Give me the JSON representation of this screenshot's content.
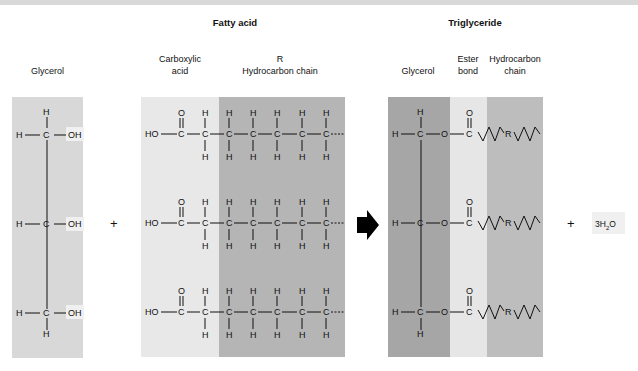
{
  "titles": {
    "fatty_acid": "Fatty acid",
    "triglyceride": "Triglyceride"
  },
  "labels": {
    "glycerol": "Glycerol",
    "carboxylic_acid_1": "Carboxylic",
    "carboxylic_acid_2": "acid",
    "r": "R",
    "hydrocarbon_chain": "Hydrocarbon chain",
    "tri_glycerol": "Glycerol",
    "ester_1": "Ester",
    "ester_2": "bond",
    "tri_hydro_1": "Hydrocarbon",
    "tri_hydro_2": "chain"
  },
  "symbols": {
    "plus": "+",
    "water": "3H₂O",
    "hydroxyl": "OH",
    "ho": "HO",
    "h": "H",
    "c": "C",
    "o": "O",
    "r": "R"
  },
  "colors": {
    "glycerol_box": "#d8d8d8",
    "carboxyl_box": "#e8e8e8",
    "hydrocarbon_box": "#b5b5b5",
    "tri_glycerol_box": "#a6a6a6",
    "ester_box": "#e6e6e6",
    "tri_hydro_box": "#bdbdbd",
    "highlight": "#f0f0f0"
  }
}
